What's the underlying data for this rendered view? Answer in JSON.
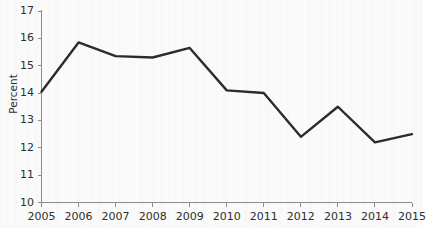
{
  "chart_data": {
    "type": "line",
    "title": "",
    "subtitle": "",
    "xlabel": "",
    "ylabel": "Percent",
    "categories": [
      "2005",
      "2006",
      "2007",
      "2008",
      "2009",
      "2010",
      "2011",
      "2012",
      "2013",
      "2014",
      "2015"
    ],
    "x": [
      2005,
      2006,
      2007,
      2008,
      2009,
      2010,
      2011,
      2012,
      2013,
      2014,
      2015
    ],
    "values": [
      14.05,
      15.85,
      15.35,
      15.3,
      15.65,
      14.1,
      14.0,
      12.4,
      13.5,
      12.2,
      12.5
    ],
    "series": [
      {
        "name": "Percent",
        "values": [
          14.05,
          15.85,
          15.35,
          15.3,
          15.65,
          14.1,
          14.0,
          12.4,
          13.5,
          12.2,
          12.5
        ]
      }
    ],
    "ylim": [
      10,
      17
    ],
    "xlim": [
      2005,
      2015
    ],
    "y_ticks": [
      10,
      11,
      12,
      13,
      14,
      15,
      16,
      17
    ],
    "y_tick_labels": [
      "10",
      "11",
      "12",
      "13",
      "14",
      "15",
      "16",
      "17"
    ],
    "x_ticks": [
      2005,
      2006,
      2007,
      2008,
      2009,
      2010,
      2011,
      2012,
      2013,
      2014,
      2015
    ],
    "x_tick_labels": [
      "2005",
      "2006",
      "2007",
      "2008",
      "2009",
      "2010",
      "2011",
      "2012",
      "2013",
      "2014",
      "2015"
    ],
    "grid": false,
    "legend": false,
    "legend_position": "none",
    "annotations": [],
    "colors": {
      "line": "#2b2b2b",
      "axis": "#8c8c8c",
      "text": "#2e2e2e",
      "background": "#fbfbfb"
    }
  },
  "axis": {
    "y_title": "Percent"
  }
}
